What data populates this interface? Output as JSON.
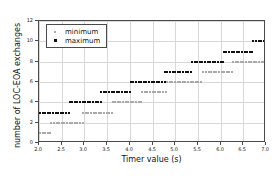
{
  "chart_data": {
    "type": "scatter",
    "title": "",
    "xlabel": "Timer value (s)",
    "ylabel": "number of LOC-EOA exchanges",
    "xlim": [
      2.0,
      7.0
    ],
    "ylim": [
      0,
      12
    ],
    "xticks": [
      "2.0",
      "2.5",
      "3.0",
      "3.5",
      "4.0",
      "4.5",
      "5.0",
      "5.5",
      "6.0",
      "6.5",
      "7.0"
    ],
    "xtick_values": [
      2.0,
      2.5,
      3.0,
      3.5,
      4.0,
      4.5,
      5.0,
      5.5,
      6.0,
      6.5,
      7.0
    ],
    "yticks": [
      "0",
      "2",
      "4",
      "6",
      "8",
      "10",
      "12"
    ],
    "ytick_values": [
      0,
      2,
      4,
      6,
      8,
      10,
      12
    ],
    "grid": true,
    "legend_position": "upper left",
    "series": [
      {
        "name": "minimum",
        "marker": "open-square",
        "color": "#a9a9a9",
        "steps": [
          {
            "x_start": 2.0,
            "x_end": 2.25,
            "y": 1
          },
          {
            "x_start": 2.25,
            "x_end": 2.95,
            "y": 2
          },
          {
            "x_start": 2.95,
            "x_end": 3.6,
            "y": 3
          },
          {
            "x_start": 3.6,
            "x_end": 4.25,
            "y": 4
          },
          {
            "x_start": 4.25,
            "x_end": 4.8,
            "y": 5
          },
          {
            "x_start": 4.8,
            "x_end": 5.6,
            "y": 6
          },
          {
            "x_start": 5.6,
            "x_end": 6.25,
            "y": 7
          },
          {
            "x_start": 6.25,
            "x_end": 7.0,
            "y": 8
          }
        ]
      },
      {
        "name": "maximum",
        "marker": "filled-square",
        "color": "#101010",
        "steps": [
          {
            "x_start": 2.0,
            "x_end": 2.65,
            "y": 3
          },
          {
            "x_start": 2.65,
            "x_end": 3.35,
            "y": 4
          },
          {
            "x_start": 3.35,
            "x_end": 4.0,
            "y": 5
          },
          {
            "x_start": 4.0,
            "x_end": 4.75,
            "y": 6
          },
          {
            "x_start": 4.75,
            "x_end": 5.35,
            "y": 7
          },
          {
            "x_start": 5.35,
            "x_end": 6.05,
            "y": 8
          },
          {
            "x_start": 6.05,
            "x_end": 6.7,
            "y": 9
          },
          {
            "x_start": 6.7,
            "x_end": 7.0,
            "y": 10
          }
        ]
      }
    ]
  },
  "legend": {
    "entries": [
      {
        "label": "minimum",
        "marker": "open-square"
      },
      {
        "label": "maximum",
        "marker": "filled-square"
      }
    ]
  }
}
